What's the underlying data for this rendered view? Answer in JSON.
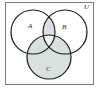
{
  "figure": {
    "type": "venn-diagram",
    "title": "",
    "universe_label": "U",
    "sets": [
      {
        "id": "A",
        "label": "A",
        "cx": 33,
        "cy": 32,
        "r": 22,
        "label_x": 28,
        "label_y": 23
      },
      {
        "id": "B",
        "label": "B",
        "cx": 65,
        "cy": 32,
        "r": 22,
        "label_x": 62,
        "label_y": 24
      },
      {
        "id": "C",
        "label": "C",
        "cx": 49,
        "cy": 57,
        "r": 22,
        "label_x": 46,
        "label_y": 66
      }
    ],
    "universe": {
      "shape": "rectangle",
      "x": 5,
      "y": 2,
      "width": 89,
      "height": 83,
      "label": "U",
      "label_x": 84,
      "label_y": 4
    },
    "shaded_regions": [
      "C",
      "A-intersect-B"
    ],
    "unshaded_regions": [
      "A-only",
      "B-only",
      "outside-all-sets"
    ],
    "colors": {
      "shade_fill": "#d7e2e0",
      "stroke": "#1a1a1a",
      "border": "#7a7a7a",
      "background": "#ffffff",
      "label_color": "#1a1a1a"
    },
    "stroke_width": 1.2,
    "border_width": 1
  }
}
